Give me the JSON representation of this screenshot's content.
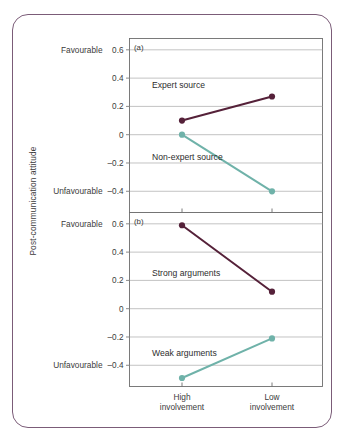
{
  "figure": {
    "y_axis_title": "Post-communication attitude",
    "axis_anchor_high": "Favourable",
    "axis_anchor_low": "Unfavourable",
    "categories": [
      "High involvement",
      "Low involvement"
    ],
    "category_lines": [
      [
        "High",
        "involvement"
      ],
      [
        "Low",
        "involvement"
      ]
    ],
    "y_ticks": [
      "0.6",
      "0.4",
      "0.2",
      "0",
      "–0.2",
      "–0.4"
    ],
    "colors": {
      "dark_series": "#552139",
      "teal_series": "#6FB2A9",
      "frame": "#7B5C78",
      "gridline": "#a9a9a9",
      "axis": "#6d6d6d",
      "text": "#3b3b3b"
    },
    "panels": [
      {
        "label": "(a)",
        "series": [
          {
            "name": "Expert source",
            "color_key": "dark_series",
            "values": [
              0.1,
              0.27
            ]
          },
          {
            "name": "Non-expert source",
            "color_key": "teal_series",
            "values": [
              0.0,
              -0.4
            ]
          }
        ]
      },
      {
        "label": "(b)",
        "series": [
          {
            "name": "Strong arguments",
            "color_key": "dark_series",
            "values": [
              0.59,
              0.12
            ]
          },
          {
            "name": "Weak arguments",
            "color_key": "teal_series",
            "values": [
              -0.49,
              -0.21
            ]
          }
        ]
      }
    ]
  },
  "chart_data": {
    "type": "line",
    "title": "",
    "xlabel": "",
    "ylabel": "Post-communication attitude",
    "x": [
      "High involvement",
      "Low involvement"
    ],
    "ylim": [
      -0.55,
      0.68
    ],
    "yticks": [
      0.6,
      0.4,
      0.2,
      0,
      -0.2,
      -0.4
    ],
    "grid": true,
    "legend": "inline-annotations",
    "panels": [
      {
        "panel": "(a)",
        "categories": [
          "High involvement",
          "Low involvement"
        ],
        "series": [
          {
            "name": "Expert source",
            "values": [
              0.1,
              0.27
            ]
          },
          {
            "name": "Non-expert source",
            "values": [
              0.0,
              -0.4
            ]
          }
        ]
      },
      {
        "panel": "(b)",
        "categories": [
          "High involvement",
          "Low involvement"
        ],
        "series": [
          {
            "name": "Strong arguments",
            "values": [
              0.59,
              0.12
            ]
          },
          {
            "name": "Weak arguments",
            "values": [
              -0.49,
              -0.21
            ]
          }
        ]
      }
    ],
    "annotations": [
      {
        "text": "Favourable",
        "axis": "y",
        "at": 0.6
      },
      {
        "text": "Unfavourable",
        "axis": "y",
        "at": -0.4
      }
    ]
  }
}
